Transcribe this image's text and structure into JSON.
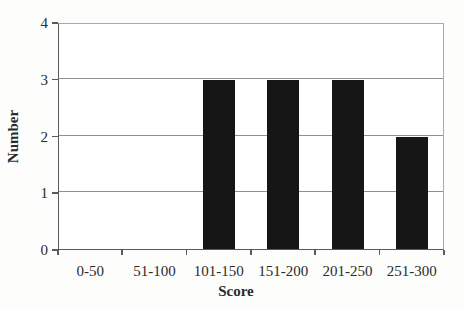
{
  "chart_data": {
    "type": "bar",
    "categories": [
      "0-50",
      "51-100",
      "101-150",
      "151-200",
      "201-250",
      "251-300"
    ],
    "values": [
      0,
      0,
      3,
      3,
      3,
      2
    ],
    "title": "",
    "xlabel": "Score",
    "ylabel": "Number",
    "ylim": [
      0,
      4
    ],
    "yticks": [
      0,
      1,
      2,
      3,
      4
    ],
    "legend": "none",
    "grid": "horizontal-gridlines",
    "bar_color": "#161616",
    "gridline_color": "#8f8f8f",
    "axis_color": "#5a5a5a"
  }
}
